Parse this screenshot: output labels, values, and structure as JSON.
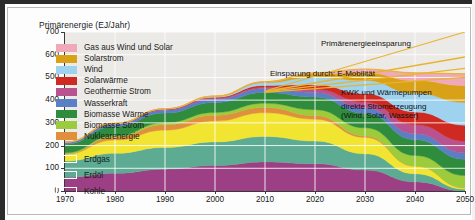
{
  "chart_data": {
    "type": "area",
    "title": "Primärenergie (EJ/Jahr)",
    "xlabel": "",
    "ylabel": "Primärenergie (EJ/Jahr)",
    "xlim": [
      1970,
      2050
    ],
    "ylim": [
      0,
      700
    ],
    "grid": true,
    "legend_position": "inside-upper-left",
    "x": [
      1970,
      1980,
      1990,
      2000,
      2010,
      2020,
      2030,
      2040,
      2050
    ],
    "xticks": [
      "1970",
      "1980",
      "1990",
      "2000",
      "2010",
      "2020",
      "2030",
      "2040",
      "2050"
    ],
    "yticks": [
      "0",
      "100",
      "200",
      "300",
      "400",
      "500",
      "600",
      "700"
    ],
    "stacked": true,
    "series": [
      {
        "name": "Kohle",
        "color": "#9c3f84",
        "values": [
          60,
          78,
          96,
          112,
          128,
          120,
          92,
          40,
          0
        ]
      },
      {
        "name": "Erdöl",
        "color": "#5cab92",
        "values": [
          72,
          88,
          96,
          104,
          112,
          100,
          72,
          36,
          8
        ]
      },
      {
        "name": "Erdgas",
        "color": "#f2e532",
        "values": [
          30,
          58,
          76,
          92,
          104,
          96,
          72,
          34,
          6
        ]
      },
      {
        "name": "Nuklearenergie",
        "color": "#e08f3c",
        "values": [
          2,
          14,
          24,
          26,
          24,
          16,
          6,
          0,
          0
        ]
      },
      {
        "name": "Biomasse Strom",
        "color": "#9ccb3b",
        "values": [
          4,
          6,
          9,
          12,
          18,
          26,
          36,
          46,
          54
        ]
      },
      {
        "name": "Biomasse Wärme",
        "color": "#2f8c3c",
        "values": [
          38,
          40,
          42,
          44,
          48,
          56,
          64,
          70,
          72
        ]
      },
      {
        "name": "Wasserkraft",
        "color": "#5b7fc4",
        "values": [
          8,
          11,
          13,
          15,
          17,
          20,
          23,
          26,
          28
        ]
      },
      {
        "name": "Geothermie Strom",
        "color": "#b8538f",
        "values": [
          1,
          2,
          3,
          4,
          6,
          14,
          26,
          40,
          52
        ]
      },
      {
        "name": "Solarwärme",
        "color": "#cf2a21",
        "values": [
          0,
          1,
          2,
          4,
          8,
          20,
          38,
          56,
          70
        ]
      },
      {
        "name": "Wind",
        "color": "#9ed2ef",
        "values": [
          0,
          0,
          1,
          4,
          12,
          32,
          58,
          82,
          100
        ]
      },
      {
        "name": "Solarstrom",
        "color": "#d8a117",
        "values": [
          0,
          0,
          0,
          1,
          4,
          16,
          34,
          56,
          74
        ]
      },
      {
        "name": "Gas aus Wind und Solar",
        "color": "#f0a9b8",
        "values": [
          0,
          0,
          0,
          0,
          0,
          4,
          16,
          34,
          52
        ]
      }
    ],
    "savings_lines": [
      {
        "name": "Primärenergieeinsparung",
        "color": "#e8b32e",
        "x": [
          2010,
          2050
        ],
        "y": [
          440,
          700
        ]
      },
      {
        "name": "Einsparung durch: E-Mobilität",
        "color": "#e8b32e",
        "x": [
          2010,
          2050
        ],
        "y": [
          438,
          590
        ]
      },
      {
        "name": "KWK und Wärmepumpen",
        "color": "#e8b32e",
        "x": [
          2010,
          2050
        ],
        "y": [
          436,
          540
        ]
      },
      {
        "name": "direkte Stromerzeugung (Wind, Solar, Wasser)",
        "color": "#e8b32e",
        "x": [
          2010,
          2050
        ],
        "y": [
          434,
          500
        ]
      }
    ]
  },
  "axis": {
    "title": "Primärenergie (EJ/Jahr)",
    "yticks": [
      "700",
      "600",
      "500",
      "400",
      "300",
      "200",
      "100",
      "0"
    ],
    "xticks": [
      "1970",
      "1980",
      "1990",
      "2000",
      "2010",
      "2020",
      "2030",
      "2040",
      "2050"
    ]
  },
  "legend": {
    "items": [
      {
        "label": "Gas aus Wind und Solar",
        "color": "#f0a9b8",
        "style": "filled"
      },
      {
        "label": "Solarstrom",
        "color": "#d8a117",
        "style": "filled"
      },
      {
        "label": "Wind",
        "color": "#9ed2ef",
        "style": "filled"
      },
      {
        "label": "Solarwärme",
        "color": "#cf2a21",
        "style": "filled"
      },
      {
        "label": "Geothermie Strom",
        "color": "#b8538f",
        "style": "filled"
      },
      {
        "label": "Wasserkraft",
        "color": "#5b7fc4",
        "style": "filled"
      },
      {
        "label": "Biomasse Wärme",
        "color": "#2f8c3c",
        "style": "filled"
      },
      {
        "label": "Biomasse Strom",
        "color": "#9ccb3b",
        "style": "filled"
      },
      {
        "label": "Nuklearenergie",
        "color": "#e08f3c",
        "style": "filled"
      }
    ],
    "items_outlined": [
      {
        "label": "Erdgas",
        "color": "#f2e532",
        "style": "outline"
      },
      {
        "label": "Erdöl",
        "color": "#5cab92",
        "style": "outline"
      },
      {
        "label": "Kohle",
        "color": "#9c3f84",
        "style": "outline"
      }
    ]
  },
  "annotations": [
    {
      "text": "Primärenergieeinsparung",
      "bold": false
    },
    {
      "text": "Einsparung durch: E-Mobilität",
      "bold": false
    },
    {
      "text": "KWK und Wärmepumpen",
      "bold": false
    },
    {
      "text": "direkte Stromerzeugung",
      "bold": false
    },
    {
      "text": "(Wind, Solar, Wasser)",
      "bold": false
    }
  ]
}
